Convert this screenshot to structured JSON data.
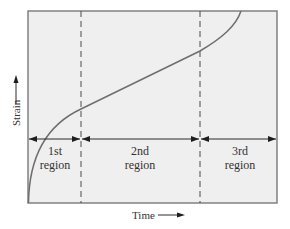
{
  "diagram": {
    "x_axis_label": "Time",
    "y_axis_label": "Strain",
    "regions": [
      {
        "line1": "1st",
        "line2": "region"
      },
      {
        "line1": "2nd",
        "line2": "region"
      },
      {
        "line1": "3rd",
        "line2": "region"
      }
    ],
    "colors": {
      "plot_background": "#efefef",
      "frame": "#7a7a7a",
      "curve": "#6e6e6e",
      "text": "#333333"
    }
  }
}
